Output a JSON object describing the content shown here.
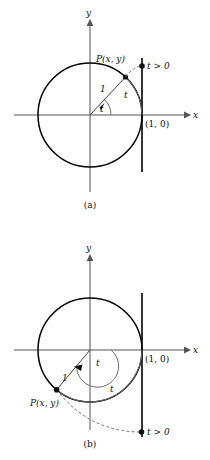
{
  "figure": {
    "type": "math-diagram",
    "colors": {
      "ink": "#111111",
      "circle": "#000000",
      "axis": "#555555",
      "arc": "#6b6b6b",
      "dashed": "#7a7a7a",
      "background": "#ffffff"
    }
  },
  "panels": [
    {
      "key": "a",
      "caption": "(a)",
      "axis_x_label": "x",
      "axis_y_label": "y",
      "point_label": "P(x, y)",
      "radius_label": "1",
      "angle_label": "t",
      "arc_label": "t",
      "terminal_label": "t > 0",
      "intercept_label": "(1, 0)",
      "center": [
        90,
        115
      ],
      "radius": 52,
      "tangent_x": 142,
      "tangent_y_top": 58,
      "tangent_y_bottom": 172,
      "point_angle_deg": 47,
      "terminal_point": [
        142,
        66
      ]
    },
    {
      "key": "b",
      "caption": "(b)",
      "axis_x_label": "x",
      "axis_y_label": "y",
      "point_label": "P(x, y)",
      "radius_label": "1",
      "angle_label": "t",
      "arc_label": "t",
      "terminal_label": "t > 0",
      "intercept_label": "(1, 0)",
      "center": [
        90,
        350
      ],
      "radius": 52,
      "tangent_x": 142,
      "tangent_y_top": 293,
      "tangent_y_bottom": 437,
      "point_angle_deg": 230,
      "terminal_point": [
        141,
        432
      ]
    }
  ]
}
